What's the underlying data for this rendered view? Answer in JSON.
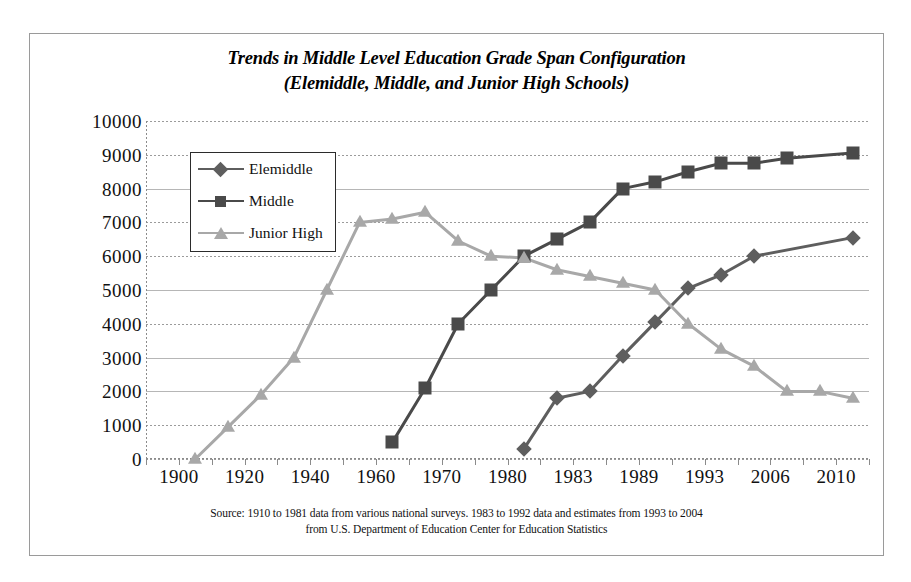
{
  "chart_data": {
    "type": "line",
    "title": "Trends in Middle Level Education Grade Span Configuration",
    "subtitle": "(Elemiddle, Middle, and Junior High Schools)",
    "xlabel": "",
    "ylabel": "",
    "ylim": [
      0,
      10000
    ],
    "ytick_step": 1000,
    "grid": true,
    "legend_position": "top-left",
    "categories": [
      "1900",
      "1910",
      "1920",
      "1930",
      "1940",
      "1950",
      "1960",
      "1965",
      "1970",
      "1976",
      "1980",
      "1983",
      "1985",
      "1989",
      "1991",
      "1993",
      "1996",
      "2000",
      "2004",
      "2006",
      "2008",
      "2010"
    ],
    "xtick_labels": [
      "1900",
      "1920",
      "1940",
      "1960",
      "1970",
      "1980",
      "1983",
      "1989",
      "1993",
      "2006",
      "2010"
    ],
    "yticks": [
      "10000",
      "9000",
      "8000",
      "7000",
      "6000",
      "5000",
      "4000",
      "3000",
      "2000",
      "1000",
      "0"
    ],
    "series": [
      {
        "name": "Elemiddle",
        "marker": "diamond",
        "color": "#5e5e5e",
        "points": [
          {
            "x": "1983",
            "y": 300
          },
          {
            "x": "1985",
            "y": 1800
          },
          {
            "x": "1989",
            "y": 2000
          },
          {
            "x": "1991",
            "y": 3050
          },
          {
            "x": "1993",
            "y": 4050
          },
          {
            "x": "1996",
            "y": 5050
          },
          {
            "x": "2000",
            "y": 5450
          },
          {
            "x": "2004",
            "y": 6000
          },
          {
            "x": "2010",
            "y": 6550
          }
        ]
      },
      {
        "name": "Middle",
        "marker": "square",
        "color": "#4a4a4a",
        "points": [
          {
            "x": "1965",
            "y": 500
          },
          {
            "x": "1970",
            "y": 2100
          },
          {
            "x": "1976",
            "y": 4000
          },
          {
            "x": "1980",
            "y": 5000
          },
          {
            "x": "1983",
            "y": 6000
          },
          {
            "x": "1985",
            "y": 6500
          },
          {
            "x": "1989",
            "y": 7000
          },
          {
            "x": "1991",
            "y": 8000
          },
          {
            "x": "1993",
            "y": 8200
          },
          {
            "x": "1996",
            "y": 8500
          },
          {
            "x": "2000",
            "y": 8750
          },
          {
            "x": "2004",
            "y": 8750
          },
          {
            "x": "2006",
            "y": 8900
          },
          {
            "x": "2010",
            "y": 9050
          }
        ]
      },
      {
        "name": "Junior High",
        "marker": "triangle",
        "color": "#a8a8a8",
        "points": [
          {
            "x": "1910",
            "y": 0
          },
          {
            "x": "1920",
            "y": 950
          },
          {
            "x": "1930",
            "y": 1900
          },
          {
            "x": "1940",
            "y": 3000
          },
          {
            "x": "1950",
            "y": 5000
          },
          {
            "x": "1960",
            "y": 7000
          },
          {
            "x": "1965",
            "y": 7100
          },
          {
            "x": "1970",
            "y": 7300
          },
          {
            "x": "1976",
            "y": 6450
          },
          {
            "x": "1980",
            "y": 6000
          },
          {
            "x": "1983",
            "y": 5950
          },
          {
            "x": "1985",
            "y": 5600
          },
          {
            "x": "1989",
            "y": 5400
          },
          {
            "x": "1991",
            "y": 5200
          },
          {
            "x": "1993",
            "y": 5000
          },
          {
            "x": "1996",
            "y": 4000
          },
          {
            "x": "2000",
            "y": 3250
          },
          {
            "x": "2004",
            "y": 2750
          },
          {
            "x": "2006",
            "y": 2000
          },
          {
            "x": "2008",
            "y": 2000
          },
          {
            "x": "2010",
            "y": 1800
          }
        ]
      }
    ]
  },
  "legend": {
    "items": [
      {
        "label": "Elemiddle",
        "marker": "diamond",
        "color": "#5e5e5e"
      },
      {
        "label": "Middle",
        "marker": "square",
        "color": "#4a4a4a"
      },
      {
        "label": "Junior High",
        "marker": "triangle",
        "color": "#a8a8a8"
      }
    ]
  },
  "source": {
    "line1": "Source: 1910 to 1981 data from various national surveys. 1983 to 1992 data and estimates from 1993 to 2004",
    "line2": "from U.S. Department of Education Center for Education Statistics"
  }
}
